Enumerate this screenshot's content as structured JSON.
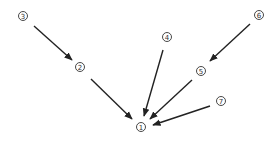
{
  "diagram": {
    "type": "directed-graph",
    "colors": {
      "edge": "#222222",
      "node_stroke": "#333333",
      "background": "#ffffff"
    },
    "nodes": [
      {
        "id": "1",
        "label": "1",
        "x": 141,
        "y": 127
      },
      {
        "id": "2",
        "label": "2",
        "x": 80,
        "y": 67
      },
      {
        "id": "3",
        "label": "3",
        "x": 23,
        "y": 16
      },
      {
        "id": "4",
        "label": "4",
        "x": 167,
        "y": 37
      },
      {
        "id": "5",
        "label": "5",
        "x": 201,
        "y": 71
      },
      {
        "id": "6",
        "label": "6",
        "x": 259,
        "y": 15
      },
      {
        "id": "7",
        "label": "7",
        "x": 221,
        "y": 101
      }
    ],
    "edges": [
      {
        "from": "3",
        "to": "2",
        "x1": 34,
        "y1": 26,
        "x2": 72,
        "y2": 60
      },
      {
        "from": "2",
        "to": "1",
        "x1": 91,
        "y1": 79,
        "x2": 132,
        "y2": 119
      },
      {
        "from": "4",
        "to": "1",
        "x1": 163,
        "y1": 50,
        "x2": 144,
        "y2": 116
      },
      {
        "from": "5",
        "to": "1",
        "x1": 192,
        "y1": 80,
        "x2": 150,
        "y2": 119
      },
      {
        "from": "6",
        "to": "5",
        "x1": 250,
        "y1": 24,
        "x2": 210,
        "y2": 61
      },
      {
        "from": "7",
        "to": "1",
        "x1": 210,
        "y1": 106,
        "x2": 153,
        "y2": 125
      }
    ]
  }
}
